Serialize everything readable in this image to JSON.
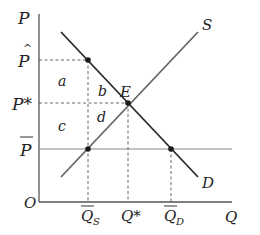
{
  "diagram": {
    "axes": {
      "y_label": "P",
      "x_label": "Q",
      "origin_label": "O"
    },
    "curves": {
      "supply_label": "S",
      "demand_label": "D"
    },
    "price_labels": {
      "p_hat": "P",
      "p_hat_accent": "^",
      "p_star": "P*",
      "p_bar": "P"
    },
    "quantity_labels": {
      "q_s": "Q",
      "q_s_sub": "S",
      "q_star": "Q*",
      "q_d": "Q",
      "q_d_sub": "D"
    },
    "points": {
      "equilibrium": "E"
    },
    "areas": {
      "a": "a",
      "b": "b",
      "c": "c",
      "d": "d"
    },
    "colors": {
      "demand": "#2a2a2a",
      "supply": "#666666",
      "axis": "#555555",
      "ceiling": "#888888",
      "dashed": "#555555",
      "point": "#1a1a1a"
    }
  }
}
